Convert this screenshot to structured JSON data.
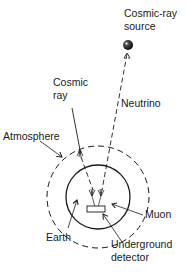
{
  "diagram": {
    "labels": {
      "source_line1": "Cosmic-ray",
      "source_line2": "source",
      "cosmic_ray_line1": "Cosmic",
      "cosmic_ray_line2": "ray",
      "neutrino": "Neutrino",
      "atmosphere": "Atmosphere",
      "muon": "Muon",
      "earth": "Earth",
      "detector_line1": "Underground",
      "detector_line2": "detector"
    },
    "colors": {
      "ink": "#1a1a1a",
      "background": "#ffffff"
    }
  }
}
